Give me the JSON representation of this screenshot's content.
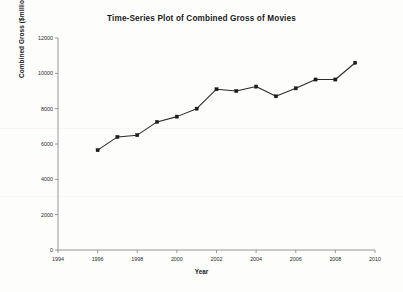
{
  "chart_data": {
    "type": "line",
    "title": "Time-Series Plot of Combined Gross of Movies",
    "xlabel": "Year",
    "ylabel": "Combined Gross ($millions)",
    "x": [
      1996,
      1997,
      1998,
      1999,
      2000,
      2001,
      2002,
      2003,
      2004,
      2005,
      2006,
      2007,
      2008,
      2009
    ],
    "values": [
      5650,
      6400,
      6500,
      7250,
      7550,
      8000,
      9100,
      9000,
      9250,
      8700,
      9150,
      9650,
      9650,
      10600
    ],
    "series": [
      {
        "name": "Combined Gross",
        "values": [
          5650,
          6400,
          6500,
          7250,
          7550,
          8000,
          9100,
          9000,
          9250,
          8700,
          9150,
          9650,
          9650,
          10600
        ]
      }
    ],
    "xlim": [
      1994,
      2010
    ],
    "ylim": [
      0,
      12000
    ],
    "xticks": [
      1994,
      1996,
      1998,
      2000,
      2002,
      2004,
      2006,
      2008,
      2010
    ],
    "xtick_labels": [
      "1994",
      "1996",
      "1998",
      "2000",
      "2002",
      "2004",
      "2006",
      "2008",
      "2010"
    ],
    "yticks": [
      0,
      2000,
      4000,
      6000,
      8000,
      10000,
      12000
    ],
    "ytick_labels": [
      "0",
      "2000",
      "4000",
      "6000",
      "8000",
      "10000",
      "12000"
    ],
    "grid": false,
    "legend": null,
    "marker": "filled-square",
    "line_color": "#2a2a2a",
    "marker_color": "#1c1c1c",
    "background_color": "#fdfdfc"
  }
}
